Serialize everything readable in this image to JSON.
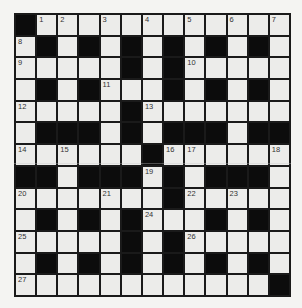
{
  "puzzle": {
    "rows": 13,
    "cols": 13,
    "layout": [
      "#............",
      ".#.#.#.#.#.#.",
      ".....#.#.....",
      ".#.#...#.#.#.",
      ".....#.......",
      ".###.#.###.##",
      "......#......",
      "##.###.#.###.",
      ".......#.....",
      ".#.#.#...#.#.",
      ".....#.#.....",
      ".#.#.#.#.#.#.",
      "............#"
    ],
    "numbers": [
      {
        "row": 0,
        "col": 1,
        "n": "1"
      },
      {
        "row": 0,
        "col": 2,
        "n": "2"
      },
      {
        "row": 0,
        "col": 4,
        "n": "3"
      },
      {
        "row": 0,
        "col": 6,
        "n": "4"
      },
      {
        "row": 0,
        "col": 8,
        "n": "5"
      },
      {
        "row": 0,
        "col": 10,
        "n": "6"
      },
      {
        "row": 0,
        "col": 12,
        "n": "7"
      },
      {
        "row": 1,
        "col": 0,
        "n": "8"
      },
      {
        "row": 2,
        "col": 0,
        "n": "9"
      },
      {
        "row": 2,
        "col": 8,
        "n": "10"
      },
      {
        "row": 3,
        "col": 4,
        "n": "11"
      },
      {
        "row": 4,
        "col": 0,
        "n": "12"
      },
      {
        "row": 4,
        "col": 6,
        "n": "13"
      },
      {
        "row": 6,
        "col": 0,
        "n": "14"
      },
      {
        "row": 6,
        "col": 2,
        "n": "15"
      },
      {
        "row": 6,
        "col": 7,
        "n": "16"
      },
      {
        "row": 6,
        "col": 8,
        "n": "17"
      },
      {
        "row": 6,
        "col": 12,
        "n": "18"
      },
      {
        "row": 7,
        "col": 6,
        "n": "19"
      },
      {
        "row": 8,
        "col": 0,
        "n": "20"
      },
      {
        "row": 8,
        "col": 4,
        "n": "21"
      },
      {
        "row": 8,
        "col": 8,
        "n": "22"
      },
      {
        "row": 8,
        "col": 10,
        "n": "23"
      },
      {
        "row": 9,
        "col": 6,
        "n": "24"
      },
      {
        "row": 10,
        "col": 0,
        "n": "25"
      },
      {
        "row": 10,
        "col": 8,
        "n": "26"
      },
      {
        "row": 12,
        "col": 0,
        "n": "27"
      }
    ],
    "colors": {
      "black_cell": "#0c0c0c",
      "white_cell": "#ececea",
      "grid_line": "#1a1a1a",
      "number_text": "#333333"
    }
  }
}
